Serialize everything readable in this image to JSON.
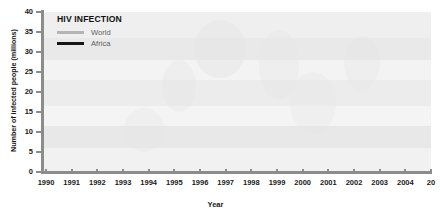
{
  "chart_data": {
    "type": "line",
    "title": "HIV INFECTION",
    "xlabel": "Year",
    "ylabel": "Number of infected people (millions)",
    "xlim": [
      1990,
      2005
    ],
    "ylim": [
      0,
      40
    ],
    "y_ticks": [
      0,
      5,
      10,
      15,
      20,
      25,
      30,
      35,
      40
    ],
    "x_ticks": [
      "1990",
      "1991",
      "1992",
      "1993",
      "1994",
      "1995",
      "1996",
      "1997",
      "1998",
      "1999",
      "2000",
      "2001",
      "2002",
      "2003",
      "2004",
      "2005"
    ],
    "x_last_tick_clipped": "20",
    "grid": false,
    "legend_position": "top-left",
    "x": [
      1990,
      1991,
      1992,
      1993,
      1994,
      1995,
      1996,
      1997,
      1998,
      1999,
      2000,
      2001,
      2002,
      2003,
      2004,
      2005
    ],
    "series": [
      {
        "name": "World",
        "color": "#b4b4b4",
        "values": [
          8.0,
          10.2,
          12.6,
          15.0,
          18.3,
          20.8,
          23.3,
          25.7,
          28.0,
          30.0,
          31.8,
          33.4,
          34.9,
          36.3,
          37.6,
          39.0
        ]
      },
      {
        "name": "Africa",
        "color": "#161616",
        "values": [
          5.0,
          6.3,
          7.7,
          9.2,
          11.8,
          13.2,
          14.6,
          16.1,
          17.6,
          19.2,
          20.5,
          21.5,
          22.4,
          23.1,
          23.6,
          24.0
        ]
      }
    ]
  },
  "legend": {
    "title": "HIV INFECTION",
    "entries": [
      {
        "label": "World"
      },
      {
        "label": "Africa"
      }
    ]
  },
  "axes": {
    "y_title": "Number of infected people (millions)",
    "x_title": "Year",
    "y_tick_labels": [
      "40",
      "35",
      "30",
      "25",
      "20",
      "15",
      "10",
      "5",
      "0"
    ],
    "x_tick_labels": [
      "1990",
      "1991",
      "1992",
      "1993",
      "1994",
      "1995",
      "1996",
      "1997",
      "1998",
      "1999",
      "2000",
      "2001",
      "2002",
      "2003",
      "2004",
      "20"
    ]
  },
  "colors": {
    "world_line": "#b4b4b4",
    "africa_line": "#161616",
    "axis": "#8c8c8c",
    "plot_background": "#f2f2f2",
    "text": "#1a1a1a"
  }
}
